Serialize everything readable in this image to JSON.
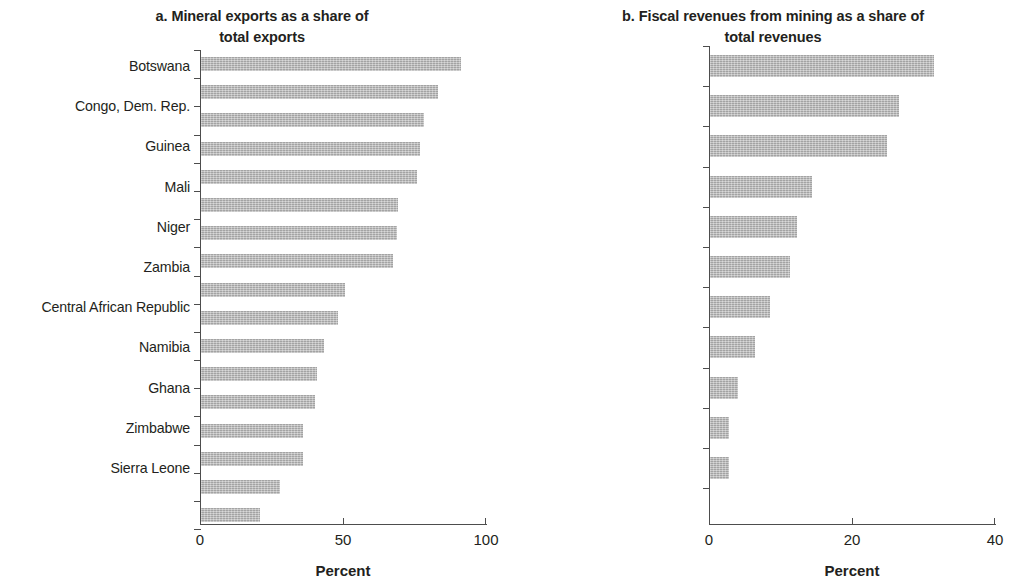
{
  "figure": {
    "bar_color": "#b7b7b7",
    "axis_color": "#4d4d4d",
    "text_color": "#231f20"
  },
  "chart_data": [
    {
      "type": "bar",
      "orientation": "horizontal",
      "panel": "a",
      "title": "a. Mineral exports as a share of total exports",
      "title_line1": "a. Mineral exports as a share of",
      "title_line2": "total exports",
      "xlabel": "Percent",
      "ylabel": "",
      "xlim": [
        0,
        100
      ],
      "xticks": [
        0,
        50,
        100
      ],
      "xtick_labels": [
        "0",
        "50",
        "100"
      ],
      "grid": false,
      "legend": null,
      "categories": [
        "Congo, Dem. Rep.",
        "Botswana",
        "Zambia",
        "Mali",
        "Mozambique",
        "Burkina Faso",
        "Mauritania",
        "Guinea",
        "Zimbabwe",
        "Ghana",
        "Namibia",
        "Tanzania",
        "Niger",
        "Central African Republic",
        "Sierra Leone",
        "Rwanda",
        "Liberia"
      ],
      "values": [
        91,
        83,
        78,
        76.5,
        75.5,
        69,
        68.5,
        67,
        50.5,
        48,
        43,
        40.5,
        40,
        35.5,
        35.5,
        27.5,
        20.5
      ]
    },
    {
      "type": "bar",
      "orientation": "horizontal",
      "panel": "b",
      "title": "b. Fiscal revenues from mining as a share of total revenues",
      "title_line1": "b. Fiscal revenues from mining as a share of",
      "title_line2": "total revenues",
      "xlabel": "Percent",
      "ylabel": "",
      "xlim": [
        0,
        40
      ],
      "xticks": [
        0,
        20,
        40
      ],
      "xtick_labels": [
        "0",
        "20",
        "40"
      ],
      "grid": false,
      "legend": null,
      "categories": [
        "Botswana",
        "Congo, Dem. Rep.",
        "Guinea",
        "Mali",
        "Niger",
        "Zambia",
        "Central African Republic",
        "Namibia",
        "Ghana",
        "Zimbabwe",
        "Sierra Leone"
      ],
      "values": [
        31.3,
        26.5,
        24.8,
        14.3,
        12.2,
        11.2,
        8.4,
        6.3,
        3.9,
        2.7,
        2.7
      ]
    }
  ]
}
